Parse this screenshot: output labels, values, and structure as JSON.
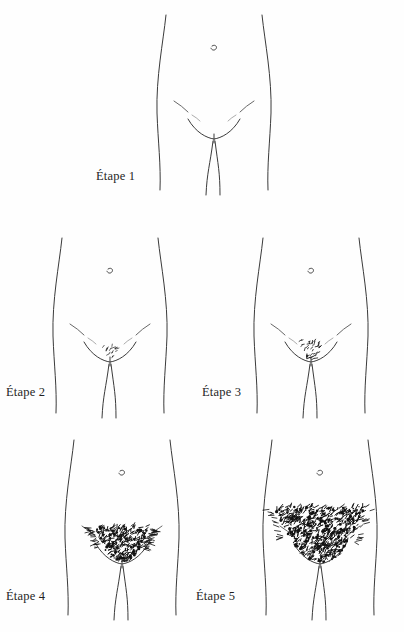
{
  "document": {
    "title": "Étapes du développement de la pilosité pubienne",
    "language": "fr",
    "background_color": "#fefefe",
    "ink_color": "#3a3a3a",
    "label_color": "#1f1f1f"
  },
  "panels": [
    {
      "id": "etape-1",
      "label": "Étape 1",
      "row": 1,
      "label_x": 96,
      "label_y": 180,
      "center_x": 214,
      "top_y": 15,
      "hair": {
        "present": false,
        "density": 0,
        "width": 0,
        "height": 0,
        "description": "aucun poil"
      }
    },
    {
      "id": "etape-2",
      "label": "Étape 2",
      "row": 2,
      "label_x": 6,
      "label_y": 396,
      "center_x": 110,
      "top_y": 238,
      "hair": {
        "present": true,
        "density": 1,
        "width": 16,
        "height": 14,
        "description": "quelques poils clairsemés"
      }
    },
    {
      "id": "etape-3",
      "label": "Étape 3",
      "row": 2,
      "label_x": 202,
      "label_y": 396,
      "center_x": 311,
      "top_y": 238,
      "hair": {
        "present": true,
        "density": 2,
        "width": 26,
        "height": 20,
        "description": "poils plus foncés et plus denses"
      }
    },
    {
      "id": "etape-4",
      "label": "Étape 4",
      "row": 3,
      "label_x": 6,
      "label_y": 600,
      "center_x": 122,
      "top_y": 440,
      "hair": {
        "present": true,
        "density": 3,
        "width": 56,
        "height": 36,
        "description": "triangle dense mais limité"
      }
    },
    {
      "id": "etape-5",
      "label": "Étape 5",
      "row": 3,
      "label_x": 196,
      "label_y": 600,
      "center_x": 320,
      "top_y": 440,
      "hair": {
        "present": true,
        "density": 4,
        "width": 92,
        "height": 56,
        "description": "pilosité adulte large et très dense"
      }
    }
  ]
}
